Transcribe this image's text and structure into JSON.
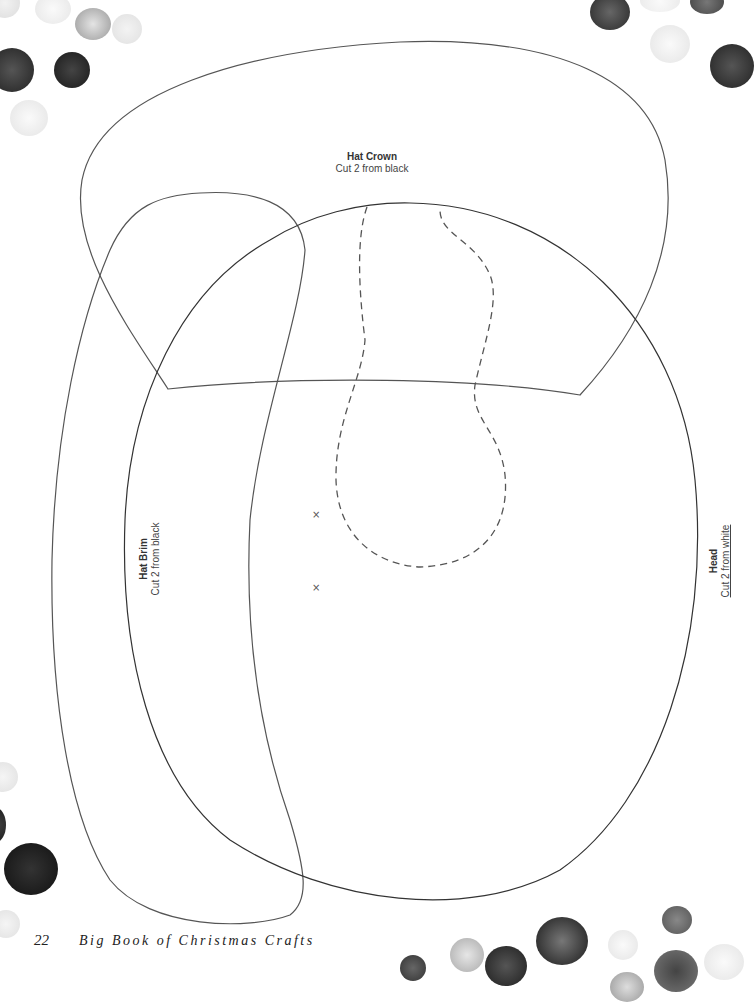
{
  "pattern_pieces": {
    "hat_crown": {
      "title": "Hat Crown",
      "instruction": "Cut 2 from black"
    },
    "hat_brim": {
      "title": "Hat Brim",
      "instruction": "Cut 2 from black"
    },
    "head": {
      "title": "Head",
      "instruction": "Cut 2 from white"
    }
  },
  "markers": {
    "x1": "×",
    "x2": "×"
  },
  "footer": {
    "page_number": "22",
    "book_title": "Big Book of Christmas Crafts"
  },
  "colors": {
    "outline": "#555555",
    "text": "#333333",
    "background": "#ffffff"
  }
}
